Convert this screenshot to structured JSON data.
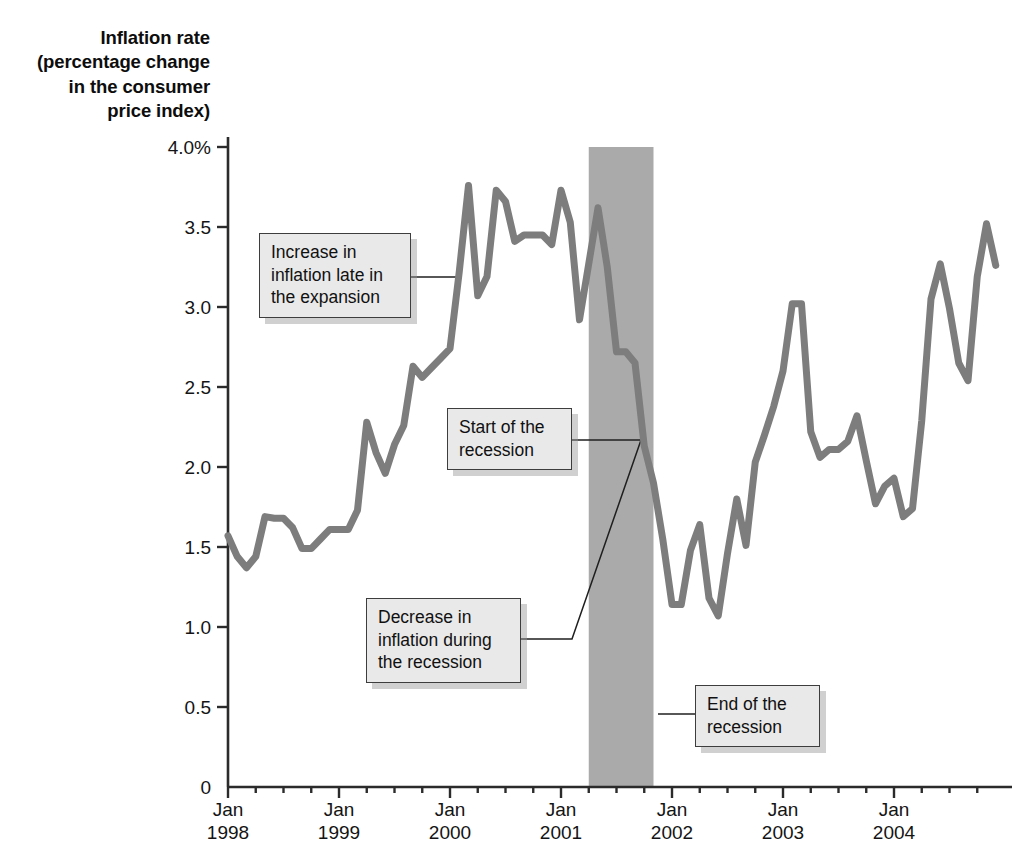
{
  "chart_data": {
    "type": "line",
    "title": "",
    "ylabel": "Inflation rate (percentage change in the consumer price index)",
    "xlabel": "",
    "ylim": [
      0,
      4.0
    ],
    "ytick_labels": [
      "0",
      "0.5",
      "1.0",
      "1.5",
      "2.0",
      "2.5",
      "3.0",
      "3.5",
      "4.0%"
    ],
    "ytick_values": [
      0,
      0.5,
      1.0,
      1.5,
      2.0,
      2.5,
      3.0,
      3.5,
      4.0
    ],
    "xtick_labels": [
      "Jan\n1998",
      "Jan\n1999",
      "Jan\n2000",
      "Jan\n2001",
      "Jan\n2002",
      "Jan\n2003",
      "Jan\n2004"
    ],
    "xtick_months": [
      "Jan",
      "Jan",
      "Jan",
      "Jan",
      "Jan",
      "Jan",
      "Jan"
    ],
    "xtick_years": [
      "1998",
      "1999",
      "2000",
      "2001",
      "2002",
      "2003",
      "2004"
    ],
    "xlim": [
      "1998-01",
      "2004-12"
    ],
    "grid": false,
    "legend": "none",
    "line_color": "#7d7d7d",
    "line_width_px": 7,
    "shaded_region": {
      "label": "recession",
      "start": "2001-04",
      "end": "2001-11",
      "color": "#aaaaaa"
    },
    "series": [
      {
        "name": "Inflation rate (CPI percentage change)",
        "x": [
          "1998-01",
          "1998-02",
          "1998-03",
          "1998-04",
          "1998-05",
          "1998-06",
          "1998-07",
          "1998-08",
          "1998-09",
          "1998-10",
          "1998-11",
          "1998-12",
          "1999-01",
          "1999-02",
          "1999-03",
          "1999-04",
          "1999-05",
          "1999-06",
          "1999-07",
          "1999-08",
          "1999-09",
          "1999-10",
          "1999-11",
          "1999-12",
          "2000-01",
          "2000-02",
          "2000-03",
          "2000-04",
          "2000-05",
          "2000-06",
          "2000-07",
          "2000-08",
          "2000-09",
          "2000-10",
          "2000-11",
          "2000-12",
          "2001-01",
          "2001-02",
          "2001-03",
          "2001-04",
          "2001-05",
          "2001-06",
          "2001-07",
          "2001-08",
          "2001-09",
          "2001-10",
          "2001-11",
          "2001-12",
          "2002-01",
          "2002-02",
          "2002-03",
          "2002-04",
          "2002-05",
          "2002-06",
          "2002-07",
          "2002-08",
          "2002-09",
          "2002-10",
          "2002-11",
          "2002-12",
          "2003-01",
          "2003-02",
          "2003-03",
          "2003-04",
          "2003-05",
          "2003-06",
          "2003-07",
          "2003-08",
          "2003-09",
          "2003-10",
          "2003-11",
          "2003-12",
          "2004-01",
          "2004-02",
          "2004-03",
          "2004-04",
          "2004-05",
          "2004-06",
          "2004-07",
          "2004-08",
          "2004-09",
          "2004-10",
          "2004-11",
          "2004-12"
        ],
        "y": [
          1.57,
          1.44,
          1.37,
          1.44,
          1.69,
          1.68,
          1.68,
          1.62,
          1.49,
          1.49,
          1.55,
          1.61,
          1.61,
          1.61,
          1.73,
          2.28,
          2.09,
          1.96,
          2.14,
          2.26,
          2.63,
          2.56,
          2.62,
          2.68,
          2.74,
          3.22,
          3.76,
          3.07,
          3.19,
          3.73,
          3.66,
          3.41,
          3.45,
          3.45,
          3.45,
          3.39,
          3.73,
          3.53,
          2.92,
          3.27,
          3.62,
          3.25,
          2.72,
          2.72,
          2.65,
          2.13,
          1.9,
          1.55,
          1.14,
          1.14,
          1.48,
          1.64,
          1.18,
          1.07,
          1.46,
          1.8,
          1.51,
          2.03,
          2.2,
          2.38,
          2.6,
          3.02,
          3.02,
          2.22,
          2.06,
          2.11,
          2.11,
          2.16,
          2.32,
          2.04,
          1.77,
          1.88,
          1.93,
          1.69,
          1.74,
          2.29,
          3.05,
          3.27,
          2.99,
          2.65,
          2.54,
          3.19,
          3.52,
          3.26
        ]
      }
    ],
    "annotations": [
      {
        "id": "increase-expansion",
        "text": "Increase in inflation late in the expansion",
        "lines": [
          "Increase in",
          "inflation late in",
          "the expansion"
        ]
      },
      {
        "id": "start-recession",
        "text": "Start of the recession",
        "lines": [
          "Start of the",
          "recession"
        ]
      },
      {
        "id": "decrease-recession",
        "text": "Decrease in inflation during the recession",
        "lines": [
          "Decrease in",
          "inflation during",
          "the recession"
        ]
      },
      {
        "id": "end-recession",
        "text": "End of the recession",
        "lines": [
          "End of the",
          "recession"
        ]
      }
    ]
  },
  "axis": {
    "title_lines": [
      "Inflation rate",
      "(percentage change",
      "in the consumer",
      "price index)"
    ],
    "y_labels": [
      "4.0%",
      "3.5",
      "3.0",
      "2.5",
      "2.0",
      "1.5",
      "1.0",
      "0.5",
      "0"
    ],
    "x_months": [
      "Jan",
      "Jan",
      "Jan",
      "Jan",
      "Jan",
      "Jan",
      "Jan"
    ],
    "x_years": [
      "1998",
      "1999",
      "2000",
      "2001",
      "2002",
      "2003",
      "2004"
    ]
  },
  "annotations": {
    "increase": {
      "l1": "Increase in",
      "l2": "inflation late in",
      "l3": "the expansion"
    },
    "start": {
      "l1": "Start of the",
      "l2": "recession"
    },
    "decrease": {
      "l1": "Decrease in",
      "l2": "inflation during",
      "l3": "the recession"
    },
    "end": {
      "l1": "End of the",
      "l2": "recession"
    }
  },
  "colors": {
    "line": "#7d7d7d",
    "recession_band": "#aaaaaa",
    "axis": "#2b2b2b",
    "callout_bg": "#e9e9e9",
    "callout_border": "#3d3d3d"
  }
}
